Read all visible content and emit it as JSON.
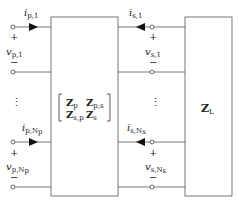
{
  "diagram": {
    "type": "circuit",
    "network_matrix": {
      "row1": [
        "Z_p",
        "Z_p,s"
      ],
      "row2": [
        "Z_s,p",
        "Z_s"
      ]
    },
    "load": "Z_L",
    "ports": {
      "primary_first": {
        "current": "i_p,1",
        "voltage": "v_p,1",
        "plus": "+",
        "minus": "−"
      },
      "primary_last": {
        "current": "i_p,Np",
        "voltage": "v_p,Np",
        "plus": "+",
        "minus": "−"
      },
      "secondary_first": {
        "current": "i_s,1",
        "voltage": "v_s,1",
        "plus": "+",
        "minus": "−"
      },
      "secondary_last": {
        "current": "i_s,Ns",
        "voltage": "v_s,Ns",
        "plus": "+",
        "minus": "−"
      }
    },
    "ellipsis": "⋮"
  },
  "labels": {
    "ip1_main": "i",
    "ip1_sub": "p,1",
    "vp1_main": "v",
    "vp1_sub": "p,1",
    "ipN_main": "i",
    "ipN_sub": "p,N",
    "vpN_main": "v",
    "vpN_sub": "p,N",
    "is1_main": "i",
    "is1_sub": "s,1",
    "vs1_main": "v",
    "vs1_sub": "s,1",
    "isN_main": "i",
    "isN_sub": "s,N",
    "vsN_main": "v",
    "vsN_sub": "s,N",
    "plus": "+",
    "minus": "−",
    "Zp": "Z",
    "Zp_sub": "p",
    "Zps": "Z",
    "Zps_sub": "p,s",
    "Zsp": "Z",
    "Zsp_sub": "s,p",
    "Zs": "Z",
    "Zs_sub": "s",
    "ZL": "Z",
    "ZL_sub": "L",
    "Np_sub": "p",
    "Ns_sub": "s",
    "dots": "⋮"
  }
}
